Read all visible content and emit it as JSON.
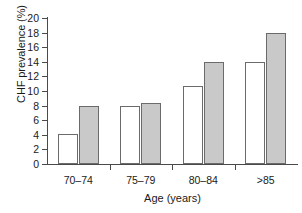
{
  "chart_data": {
    "type": "bar",
    "title": "",
    "subtitle": "",
    "xlabel": "Age (years)",
    "ylabel": "CHF prevalence (%)",
    "categories": [
      "70–74",
      "75–79",
      "80–84",
      ">85"
    ],
    "series": [
      {
        "name": "white-bar",
        "fill": "#ffffff",
        "values": [
          4.1,
          7.9,
          10.7,
          14.0
        ]
      },
      {
        "name": "gray-bar",
        "fill": "#c9c9c9",
        "values": [
          8.0,
          8.3,
          14.0,
          17.9
        ]
      }
    ],
    "ylim": [
      0,
      20
    ],
    "yticks": [
      0,
      2,
      4,
      6,
      8,
      10,
      12,
      14,
      16,
      18,
      20
    ],
    "ytick_labels": [
      "0",
      "2",
      "4",
      "6",
      "8",
      "10",
      "12",
      "14",
      "16",
      "18",
      "20"
    ],
    "grid": false,
    "legend": "none",
    "legend_position": "none",
    "annotations": []
  },
  "axes": {
    "y_title": "CHF prevalence (%)",
    "x_title": "Age (years)"
  }
}
